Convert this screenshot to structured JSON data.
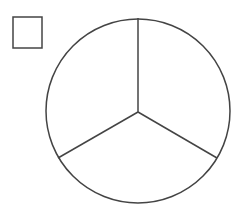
{
  "diagram": {
    "stroke_color": "#444444",
    "background": "#ffffff",
    "square": {
      "x": 13,
      "y": 17,
      "width": 29,
      "height": 31
    },
    "circle": {
      "cx": 138,
      "cy": 111,
      "r": 92
    },
    "center": {
      "x": 138,
      "y": 112
    },
    "spokes": [
      {
        "name": "top",
        "x2": 138,
        "y2": 18
      },
      {
        "name": "lower-left",
        "x2": 58,
        "y2": 158
      },
      {
        "name": "lower-right",
        "x2": 217,
        "y2": 158
      }
    ],
    "sector_count": 3
  }
}
